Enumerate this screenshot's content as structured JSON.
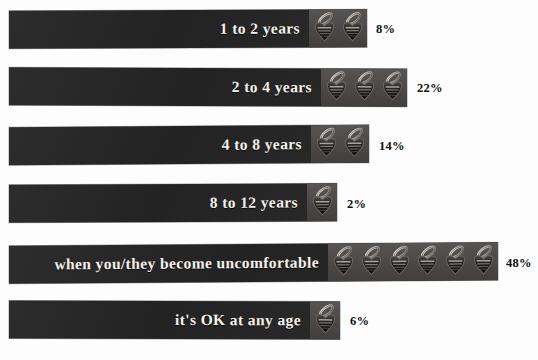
{
  "chart_data": {
    "type": "bar",
    "title": "",
    "subtitle": "",
    "xlabel": "",
    "ylabel": "",
    "orientation": "horizontal",
    "grid": false,
    "legend": "none",
    "value_suffix": "%",
    "icon_name": "pacifier-icon",
    "icon_unit_value": 8,
    "xlim": [
      0,
      50
    ],
    "categories": [
      "1 to 2 years",
      "2 to 4 years",
      "4 to 8 years",
      "8 to 12 years",
      "when you/they become uncomfortable",
      "it's OK at any age"
    ],
    "values": [
      8,
      22,
      14,
      2,
      48,
      6
    ],
    "value_labels": [
      "8%",
      "22%",
      "14%",
      "2%",
      "48%",
      "6%"
    ],
    "icon_counts": [
      2,
      3,
      2,
      1,
      6,
      1
    ],
    "colors": {
      "bar_fill": "#262525",
      "icon_strip_fill": "#4a4746",
      "label_text": "#f5f2ec",
      "value_text": "#111010",
      "background": "#fdfdfd"
    }
  },
  "bars": [
    {
      "label": "1 to 2 years",
      "value_label": "8%",
      "icons": 2,
      "bar_left": 9,
      "bar_top": 10,
      "bar_width": 358,
      "label_width": 303,
      "pct_left": 376,
      "pct_top": 22,
      "skew": "skew-a"
    },
    {
      "label": "2 to 4 years",
      "value_label": "22%",
      "icons": 3,
      "bar_left": 9,
      "bar_top": 68,
      "bar_width": 398,
      "label_width": 313,
      "pct_left": 417,
      "pct_top": 81,
      "skew": "skew-b"
    },
    {
      "label": "4 to 8 years",
      "value_label": "14%",
      "icons": 2,
      "bar_left": 9,
      "bar_top": 126,
      "bar_width": 360,
      "label_width": 305,
      "pct_left": 379,
      "pct_top": 139,
      "skew": "skew-c"
    },
    {
      "label": "8 to 12 years",
      "value_label": "2%",
      "icons": 1,
      "bar_left": 9,
      "bar_top": 184,
      "bar_width": 328,
      "label_width": 300,
      "pct_left": 347,
      "pct_top": 197,
      "skew": "skew-a"
    },
    {
      "label": "when you/they become uncomfortable",
      "value_label": "48%",
      "icons": 6,
      "bar_left": 9,
      "bar_top": 244,
      "bar_width": 489,
      "label_width": 318,
      "pct_left": 506,
      "pct_top": 256,
      "skew": "skew-c"
    },
    {
      "label": "it's OK at any age",
      "value_label": "6%",
      "icons": 1,
      "bar_left": 9,
      "bar_top": 301,
      "bar_width": 331,
      "label_width": 303,
      "pct_left": 350,
      "pct_top": 314,
      "skew": "skew-b"
    }
  ],
  "footer": {
    "ghost_text": ""
  }
}
